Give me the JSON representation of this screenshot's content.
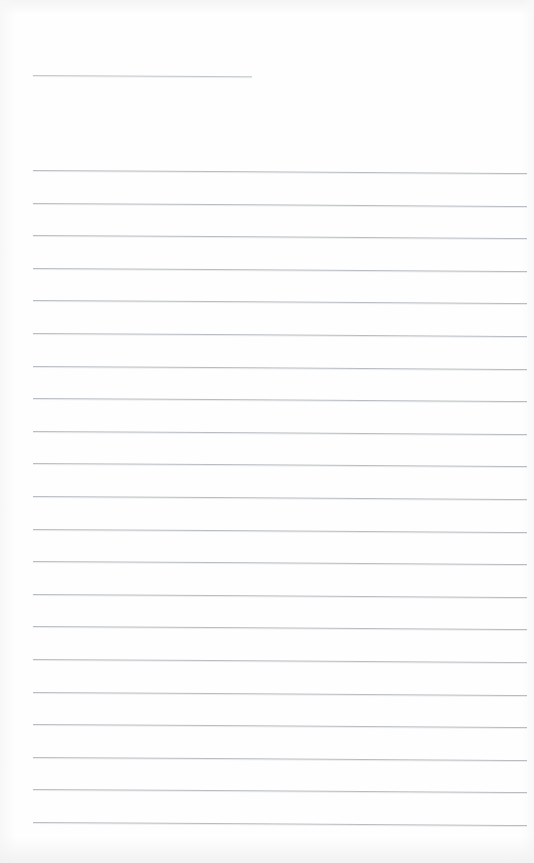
{
  "document": {
    "kind": "scanned-lined-notepad-page",
    "title": "Blank ruled notepad page",
    "content_text": "",
    "page_width": 534,
    "page_height": 863,
    "background_color": "#fefefe",
    "rule_color": "#b9bdc2",
    "header_rule_color": "#c3c7cb",
    "left_margin_x": 33,
    "right_end_x": 527,
    "skew_degrees": 0.35
  },
  "header_rule": {
    "name": "header-name-rule",
    "y": 75,
    "x_start": 33,
    "x_end": 252,
    "length": 219
  },
  "body_rules": {
    "count": 21,
    "first_y": 170,
    "spacing": 32.6,
    "x_start": 33,
    "x_end": 527,
    "lines": [
      {
        "index": 1,
        "y": 170,
        "x_start": 33,
        "x_end": 527
      },
      {
        "index": 2,
        "y": 203,
        "x_start": 33,
        "x_end": 527
      },
      {
        "index": 3,
        "y": 235,
        "x_start": 33,
        "x_end": 527
      },
      {
        "index": 4,
        "y": 268,
        "x_start": 33,
        "x_end": 527
      },
      {
        "index": 5,
        "y": 300,
        "x_start": 33,
        "x_end": 527
      },
      {
        "index": 6,
        "y": 333,
        "x_start": 33,
        "x_end": 527
      },
      {
        "index": 7,
        "y": 366,
        "x_start": 33,
        "x_end": 527
      },
      {
        "index": 8,
        "y": 398,
        "x_start": 33,
        "x_end": 527
      },
      {
        "index": 9,
        "y": 431,
        "x_start": 33,
        "x_end": 527
      },
      {
        "index": 10,
        "y": 463,
        "x_start": 33,
        "x_end": 527
      },
      {
        "index": 11,
        "y": 496,
        "x_start": 33,
        "x_end": 527
      },
      {
        "index": 12,
        "y": 529,
        "x_start": 33,
        "x_end": 527
      },
      {
        "index": 13,
        "y": 561,
        "x_start": 33,
        "x_end": 527
      },
      {
        "index": 14,
        "y": 594,
        "x_start": 33,
        "x_end": 527
      },
      {
        "index": 15,
        "y": 626,
        "x_start": 33,
        "x_end": 527
      },
      {
        "index": 16,
        "y": 659,
        "x_start": 33,
        "x_end": 527
      },
      {
        "index": 17,
        "y": 692,
        "x_start": 33,
        "x_end": 527
      },
      {
        "index": 18,
        "y": 724,
        "x_start": 33,
        "x_end": 527
      },
      {
        "index": 19,
        "y": 757,
        "x_start": 33,
        "x_end": 527
      },
      {
        "index": 20,
        "y": 789,
        "x_start": 33,
        "x_end": 527
      },
      {
        "index": 21,
        "y": 822,
        "x_start": 33,
        "x_end": 527
      }
    ]
  }
}
